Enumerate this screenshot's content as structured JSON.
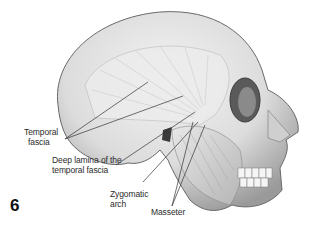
{
  "figure": {
    "number": "6",
    "labels": {
      "temporal_fascia": [
        "Temporal",
        "fascia"
      ],
      "deep_lamina": [
        "Deep lamina of the",
        "temporal fascia"
      ],
      "zygomatic_arch": [
        "Zygomatic",
        "arch"
      ],
      "masseter": [
        "Masseter"
      ]
    }
  }
}
